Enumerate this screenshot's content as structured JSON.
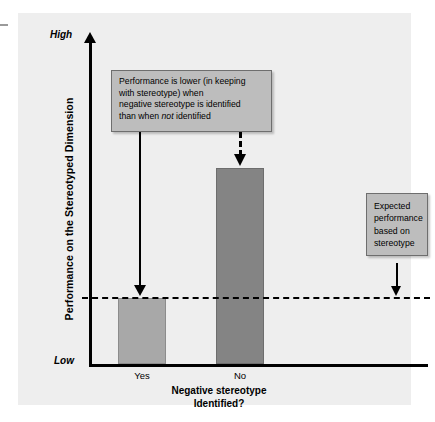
{
  "figure": {
    "background_color": "#eeeeee",
    "page_color": "#ffffff"
  },
  "axes": {
    "y_title": "Performance on the Stereotyped Dimension",
    "y_high_label": "High",
    "y_low_label": "Low",
    "x_title_line1": "Negative stereotype",
    "x_title_line2": "Identified?"
  },
  "callouts": {
    "main": {
      "line1": "Performance is lower (in keeping",
      "line2": "with stereotype) when",
      "line3": "negative stereotype is identified",
      "line4_before": "than when ",
      "line4_italic": "not",
      "line4_after": " identified",
      "fill_color": "#bdbdbd",
      "border_color": "#6e6e6e"
    },
    "expected": {
      "line1": "Expected",
      "line2": "performance",
      "line3": "based on",
      "line4": "stereotype",
      "fill_color": "#bdbdbd",
      "border_color": "#6e6e6e"
    }
  },
  "annotations": {
    "solid_arrow_target": "Yes bar top / dashed reference line",
    "dashed_arrow_target": "No bar top",
    "expected_arrow_target": "dashed reference line"
  },
  "chart_data": {
    "type": "bar",
    "title": "",
    "xlabel": "Negative stereotype Identified?",
    "ylabel": "Performance on the Stereotyped Dimension",
    "categories": [
      "Yes",
      "No"
    ],
    "values": [
      34,
      100
    ],
    "ylim": [
      0,
      166
    ],
    "ytick_labels": [
      "Low",
      "High"
    ],
    "grid": false,
    "legend": false,
    "bar_colors": [
      "#a8a8a8",
      "#848484"
    ],
    "reference_line": {
      "label": "Expected performance based on stereotype",
      "value": 34,
      "style": "dashed",
      "color": "#000000"
    }
  }
}
